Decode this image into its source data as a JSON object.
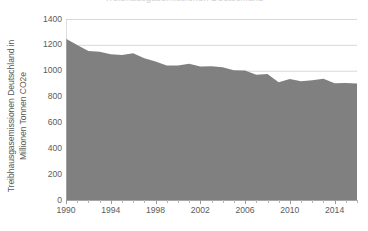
{
  "title_remnant": "Treibhausgasemissionen Deutschland",
  "axes": {
    "y_title_line1": "Treibhausgasemissionen Deutschland in",
    "y_title_line2": "Millionen Tonnen CO2e",
    "x_title": ""
  },
  "colors": {
    "series_fill": "#808080",
    "gridline": "#d9d9d9",
    "axis_line": "#a6a6a6",
    "tick_text": "#5c5c5c",
    "background": "#ffffff"
  },
  "chart_data": {
    "type": "area",
    "title": "Treibhausgasemissionen Deutschland",
    "xlabel": "",
    "ylabel": "Treibhausgasemissionen Deutschland in Millionen Tonnen CO2e",
    "xlim": [
      1990,
      2016
    ],
    "ylim": [
      0,
      1400
    ],
    "ytick_labels": [
      "0",
      "200",
      "400",
      "600",
      "800",
      "1000",
      "1200",
      "1400"
    ],
    "yticks": [
      0,
      200,
      400,
      600,
      800,
      1000,
      1200,
      1400
    ],
    "xtick_labels": [
      "1990",
      "1994",
      "1998",
      "2002",
      "2006",
      "2010",
      "2014"
    ],
    "xticks": [
      1990,
      1994,
      1998,
      2002,
      2006,
      2010,
      2014
    ],
    "xtick_minor": [
      1991,
      1992,
      1993,
      1995,
      1996,
      1997,
      1999,
      2000,
      2001,
      2003,
      2004,
      2005,
      2007,
      2008,
      2009,
      2011,
      2012,
      2013,
      2015,
      2016
    ],
    "grid": true,
    "grid_axis": "y",
    "legend": false,
    "x": [
      1990,
      1991,
      1992,
      1993,
      1994,
      1995,
      1996,
      1997,
      1998,
      1999,
      2000,
      2001,
      2002,
      2003,
      2004,
      2005,
      2006,
      2007,
      2008,
      2009,
      2010,
      2011,
      2012,
      2013,
      2014,
      2015,
      2016
    ],
    "categories": [
      "1990",
      "1991",
      "1992",
      "1993",
      "1994",
      "1995",
      "1996",
      "1997",
      "1998",
      "1999",
      "2000",
      "2001",
      "2002",
      "2003",
      "2004",
      "2005",
      "2006",
      "2007",
      "2008",
      "2009",
      "2010",
      "2011",
      "2012",
      "2013",
      "2014",
      "2015",
      "2016"
    ],
    "series": [
      {
        "name": "Treibhausgasemissionen Deutschland",
        "color": "#808080",
        "values": [
          1248,
          1199,
          1152,
          1147,
          1128,
          1122,
          1136,
          1097,
          1072,
          1041,
          1040,
          1053,
          1032,
          1035,
          1026,
          1003,
          1001,
          968,
          975,
          910,
          936,
          919,
          927,
          938,
          904,
          905,
          901
        ]
      }
    ]
  }
}
